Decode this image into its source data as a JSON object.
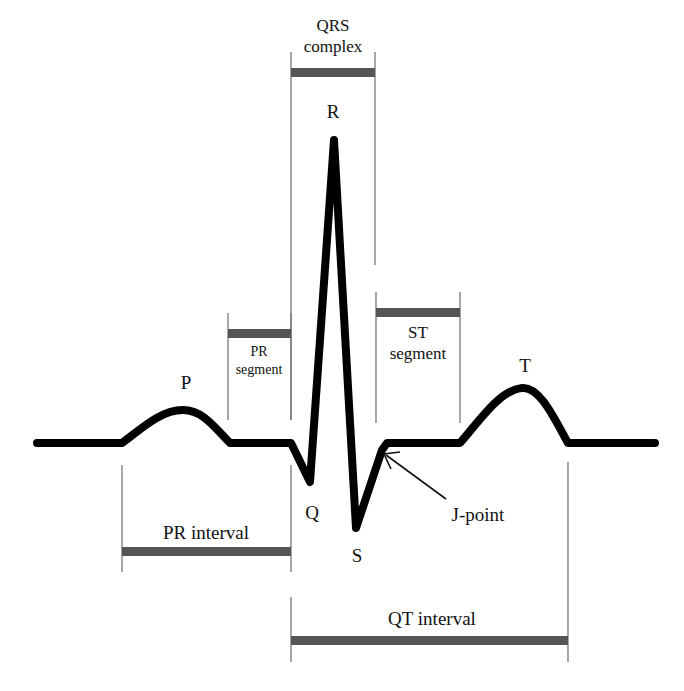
{
  "colors": {
    "background": "#ffffff",
    "waveform": "#000000",
    "bar": "#555555",
    "guide": "#777777",
    "text": "#111111"
  },
  "waves": {
    "P": "P",
    "Q": "Q",
    "R": "R",
    "S": "S",
    "T": "T"
  },
  "segments": {
    "pr_segment": {
      "line1": "PR",
      "line2": "segment"
    },
    "st_segment": {
      "line1": "ST",
      "line2": "segment"
    },
    "qrs_complex": {
      "line1": "QRS",
      "line2": "complex"
    }
  },
  "intervals": {
    "pr_interval": "PR interval",
    "qt_interval": "QT interval"
  },
  "annotations": {
    "j_point": "J-point"
  }
}
